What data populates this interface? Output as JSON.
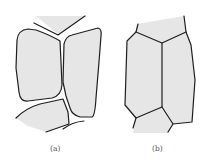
{
  "figure": {
    "type": "grain-boundary-diagram",
    "panels": [
      {
        "id": "a",
        "label": "(a)",
        "description": "Grains separated by gaps (rounded, detached cells)"
      },
      {
        "id": "b",
        "label": "(b)",
        "description": "Grains in contact forming a polygonal network"
      }
    ],
    "colors": {
      "cell_fill": "#e6e6e6",
      "boundary": "#1e1e1e",
      "label": "#555555"
    }
  }
}
